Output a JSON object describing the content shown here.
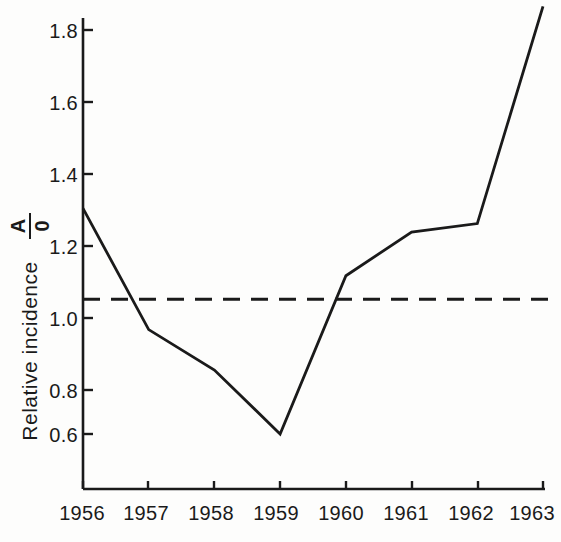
{
  "chart_data": {
    "type": "line",
    "title": "",
    "xlabel": "",
    "ylabel": "Relative incidence",
    "ylabel_symbol_numerator": "A",
    "ylabel_symbol_denominator": "0",
    "categories": [
      "1956",
      "1957",
      "1958",
      "1959",
      "1960",
      "1961",
      "1962",
      "1963"
    ],
    "x": [
      1956,
      1957,
      1958,
      1959,
      1960,
      1961,
      1962,
      1963
    ],
    "values": [
      1.27,
      0.91,
      0.79,
      0.6,
      1.07,
      1.2,
      1.225,
      1.87
    ],
    "series": [
      {
        "name": "Relative incidence",
        "values": [
          1.27,
          0.91,
          0.79,
          0.6,
          1.07,
          1.2,
          1.225,
          1.87
        ]
      }
    ],
    "reference_line": {
      "value": 1.0,
      "style": "dashed",
      "label": ""
    },
    "ylim": [
      0.44,
      1.9
    ],
    "xlim": [
      1956,
      1963
    ],
    "ytick_values": [
      1.8,
      1.6,
      1.4,
      1.2,
      1.0,
      0.8,
      0.6
    ],
    "ytick_labels": [
      "1.8",
      "1.6",
      "1.4",
      "1.2",
      "1.0",
      "0.8",
      "0.6"
    ],
    "xtick_labels": [
      "1956",
      "1957",
      "1958",
      "1959",
      "1960",
      "1961",
      "1962",
      "1963"
    ],
    "grid": false,
    "legend": "none",
    "line_color": "#1a1a1a",
    "axis_color": "#1a1a1a",
    "background_color": "#fdfdfc"
  },
  "axis": {
    "y_labels": [
      "1.8",
      "1.6",
      "1.4",
      "1.2",
      "1.0",
      "0.8",
      "0.6"
    ],
    "x_labels": [
      "1956",
      "1957",
      "1958",
      "1959",
      "1960",
      "1961",
      "1962",
      "1963"
    ],
    "y_title": "Relative  incidence",
    "y_symbol_top": "A",
    "y_symbol_bottom": "0"
  }
}
